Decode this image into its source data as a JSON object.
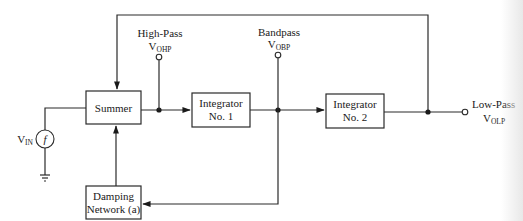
{
  "diagram": {
    "blocks": {
      "summer": {
        "label": "Summer"
      },
      "integrator1": {
        "line1": "Integrator",
        "line2": "No. 1"
      },
      "integrator2": {
        "line1": "Integrator",
        "line2": "No. 2"
      },
      "damping": {
        "line1": "Damping",
        "line2": "Network (a)"
      }
    },
    "outputs": {
      "high_pass": {
        "label": "High-Pass",
        "symbol_main": "V",
        "symbol_sub": "OHP"
      },
      "bandpass": {
        "label": "Bandpass",
        "symbol_main": "V",
        "symbol_sub": "OBP"
      },
      "low_pass": {
        "label": "Low-Pass",
        "symbol_main": "V",
        "symbol_sub": "OLP"
      }
    },
    "input": {
      "symbol_main": "V",
      "symbol_sub": "IN",
      "source_glyph": "f"
    },
    "colors": {
      "line": "#2a2a2a",
      "text": "#1a1a1a",
      "background": "#ffffff"
    }
  }
}
